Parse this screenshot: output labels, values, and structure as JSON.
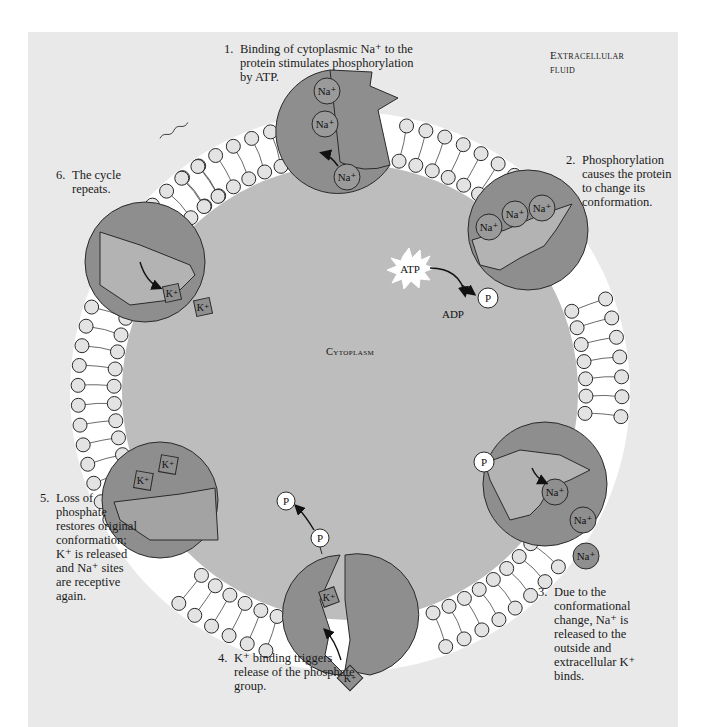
{
  "region_labels": {
    "extracellular_line1": "Extracellular",
    "extracellular_line2": "fluid",
    "cytoplasm": "Cytoplasm"
  },
  "steps": [
    {
      "number": "1.",
      "text": "Binding of cytoplasmic Na⁺ to the protein stimulates phosphorylation by ATP."
    },
    {
      "number": "2.",
      "text": "Phosphorylation causes the protein to change its conformation."
    },
    {
      "number": "3.",
      "text": "Due to the conformational change, Na⁺ is released to the outside and extracellular K⁺ binds."
    },
    {
      "number": "4.",
      "text": "K⁺ binding triggers release of the phosphate group."
    },
    {
      "number": "5.",
      "text": "Loss of phosphate restores original conformation; K⁺ is released and Na⁺ sites are receptive again."
    },
    {
      "number": "6.",
      "text": "The cycle repeats."
    }
  ],
  "molecules": {
    "atp": "ATP",
    "adp": "ADP",
    "phosphate": "P",
    "sodium": "Na⁺",
    "potassium": "K⁺"
  },
  "colors": {
    "panel_bg": "#e9e9e9",
    "cytoplasm": "#bdbdbd",
    "membrane_gap": "#ffffff",
    "protein_dark": "#8e8e8e",
    "protein_light": "#a3a3a3",
    "ion_fill": "#8f8f8f",
    "outline": "#2a2a2a"
  }
}
